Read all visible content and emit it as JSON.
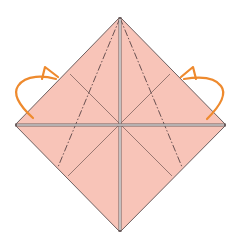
{
  "diagram": {
    "title": "",
    "type": "origami-fold-step",
    "colors": {
      "paper": "#f8c4b8",
      "edge": "#6e6060",
      "crease": "#8f6f6a",
      "mountain_fold": "#6a5252",
      "layer_gap": "#ffffff",
      "arrow": "#ee8a2e"
    },
    "shape": {
      "top": [
        120,
        17
      ],
      "right": [
        226,
        125
      ],
      "bottom": [
        120,
        232
      ],
      "left": [
        15,
        125
      ],
      "center": [
        120,
        125
      ]
    },
    "creases": [
      {
        "name": "diagonal-crease-a",
        "from": [
          70,
          74
        ],
        "to": [
          172,
          176
        ]
      },
      {
        "name": "diagonal-crease-b",
        "from": [
          170,
          74
        ],
        "to": [
          68,
          176
        ]
      }
    ],
    "mountain_folds": [
      {
        "name": "mountain-fold-left",
        "from": [
          120,
          17
        ],
        "to": [
          58,
          167
        ]
      },
      {
        "name": "mountain-fold-right",
        "from": [
          120,
          17
        ],
        "to": [
          182,
          167
        ]
      }
    ],
    "arrows": [
      {
        "name": "fold-behind-arrow-left",
        "side": "left"
      },
      {
        "name": "fold-behind-arrow-right",
        "side": "right"
      }
    ]
  }
}
